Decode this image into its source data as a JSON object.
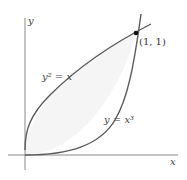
{
  "diagram": {
    "axes": {
      "x_label": "x",
      "y_label": "y"
    },
    "curves": [
      {
        "label": "y² = x",
        "equation": "y^2 = x"
      },
      {
        "label": "y = x³",
        "equation": "y = x^3"
      }
    ],
    "intersection": {
      "label": "(1, 1)",
      "x": 1,
      "y": 1
    },
    "colors": {
      "curve": "#5a5a5a",
      "axis": "#8a8a8a",
      "fill": "#f4f4f4"
    }
  }
}
